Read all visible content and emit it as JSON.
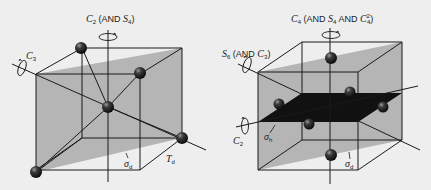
{
  "figure": {
    "left_panel": {
      "group_label": "Td",
      "axis_labels": {
        "vertical": {
          "main": "C",
          "main_sub": "2",
          "paren": "(AND ",
          "second": "S",
          "second_sub": "4",
          "close": ")"
        },
        "diagonal": {
          "main": "C",
          "main_sub": "3"
        }
      },
      "plane_label": {
        "main": "σ",
        "sub": "d"
      },
      "group": {
        "main": "T",
        "sub": "d"
      },
      "atom_count": 5
    },
    "right_panel": {
      "axis_labels": {
        "vertical": {
          "main": "C",
          "main_sub": "4",
          "paren": "(AND ",
          "second": "S",
          "second_sub": "4",
          "and2": " AND ",
          "third": "C",
          "third_sub": "4",
          "third_sup": "2",
          "close": ")"
        },
        "diagonal": {
          "main": "S",
          "main_sub": "6",
          "paren": "(AND ",
          "second": "C",
          "second_sub": "3",
          "close": ")"
        },
        "horizontal": {
          "main": "C",
          "main_sub": "2"
        }
      },
      "plane_labels": [
        {
          "main": "σ",
          "sub": "h"
        },
        {
          "main": "σ",
          "sub": "d"
        }
      ],
      "atom_count": 7
    },
    "colors": {
      "background": "#eeeeee",
      "plane_gray": "#b5b5b5",
      "dark_plane": "#111111",
      "lines": "#1a1a1a",
      "atom": "#2a2a2a"
    }
  }
}
